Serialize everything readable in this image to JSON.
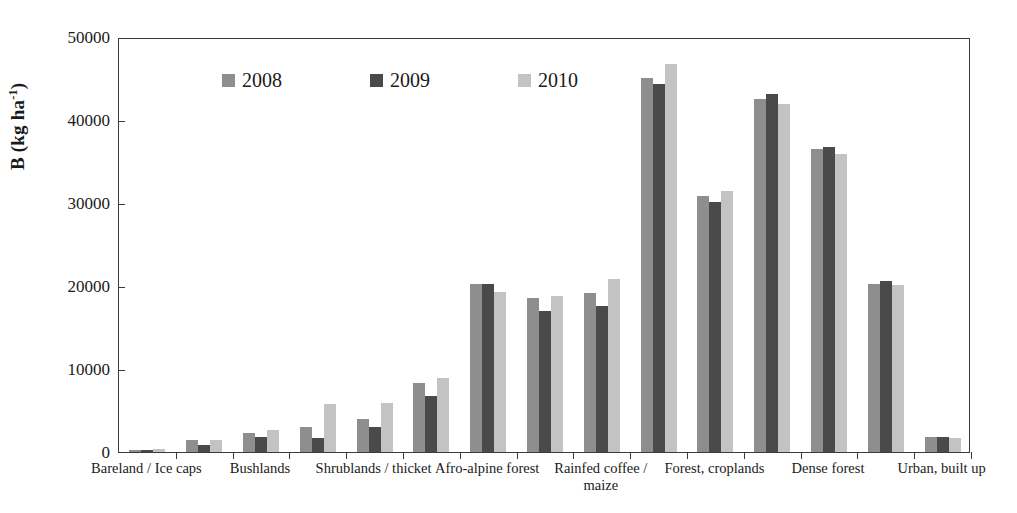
{
  "chart_data": {
    "type": "bar",
    "title": "",
    "xlabel": "",
    "ylabel": "B (kg ha-1)",
    "ylabel_base": "B (kg ha",
    "ylabel_sup": "-1",
    "ylabel_close": ")",
    "ylim": [
      0,
      50000
    ],
    "ytick_values": [
      50000,
      40000,
      30000,
      20000,
      10000,
      0
    ],
    "ytick_labels": [
      "50000",
      "40000",
      "30000",
      "20000",
      "10000",
      "0"
    ],
    "grid": false,
    "legend_position": "top-left-inside",
    "categories": [
      "Bareland / Ice caps",
      "",
      "Bushlands",
      "",
      "Shrublands / thicket",
      "",
      "Afro-alpine forest",
      "",
      "Rainfed coffee /\nmaize",
      "",
      "Forest, croplands",
      "",
      "Dense forest",
      "",
      "Urban, built up"
    ],
    "labeled_categories": [
      "Bareland / Ice caps",
      "Bushlands",
      "Shrublands / thicket",
      "Afro-alpine forest",
      "Rainfed coffee /\nmaize",
      "Forest, croplands",
      "Dense forest",
      "Urban, built up"
    ],
    "series": [
      {
        "name": "2008",
        "color": "#8e8e8e",
        "values": [
          300,
          1450,
          2250,
          3000,
          3950,
          8350,
          20200,
          18550,
          19200,
          45100,
          30900,
          42550,
          36500,
          20250,
          1750
        ]
      },
      {
        "name": "2009",
        "color": "#4a4a4a",
        "values": [
          250,
          800,
          1800,
          1700,
          3050,
          6700,
          20300,
          17050,
          17550,
          44350,
          30150,
          43100,
          36700,
          20550,
          1800
        ]
      },
      {
        "name": "2010",
        "color": "#c3c3c3",
        "values": [
          400,
          1500,
          2650,
          5800,
          5850,
          8950,
          19300,
          18800,
          20850,
          46700,
          31400,
          41900,
          35900,
          20150,
          1650
        ]
      }
    ]
  },
  "legend": {
    "items": [
      {
        "label": "2008",
        "color": "#8e8e8e"
      },
      {
        "label": "2009",
        "color": "#4a4a4a"
      },
      {
        "label": "2010",
        "color": "#c3c3c3"
      }
    ]
  }
}
